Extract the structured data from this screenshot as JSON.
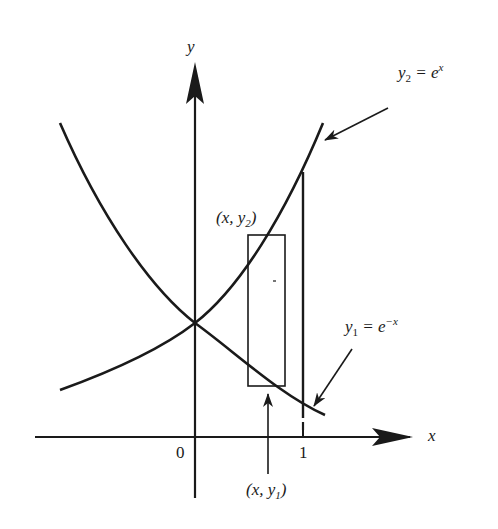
{
  "figure": {
    "type": "diagram",
    "colors": {
      "ink": "#1a1a1a",
      "background": "#ffffff"
    }
  },
  "axes": {
    "x_label": "x",
    "y_label": "y",
    "origin_label": "0",
    "tick_labels": [
      "1"
    ]
  },
  "curves": [
    {
      "id": "y2",
      "name": "y",
      "subscript": "2",
      "equals": " = e",
      "superscript": "x",
      "expression": "y2 = e^x"
    },
    {
      "id": "y1",
      "name": "y",
      "subscript": "1",
      "equals": " = e",
      "superscript": "−x",
      "expression": "y1 = e^-x"
    }
  ],
  "annotations": {
    "top_point": {
      "open": "(x, y",
      "subscript": "2",
      "close": ")"
    },
    "bottom_point": {
      "open": "(x, y",
      "subscript": "1",
      "close": ")"
    }
  }
}
